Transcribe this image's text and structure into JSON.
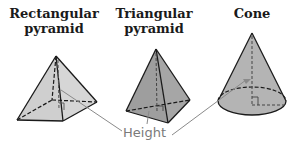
{
  "figures": [
    {
      "id": "rectangular-pyramid",
      "title_line1": "Rectangular",
      "title_line2": "pyramid"
    },
    {
      "id": "triangular-pyramid",
      "title_line1": "Triangular",
      "title_line2": "pyramid"
    },
    {
      "id": "cone",
      "title_line1": "Cone",
      "title_line2": ""
    }
  ],
  "label": {
    "height": "Height"
  },
  "colors": {
    "rect_fill": "#d6d6d6",
    "tri_fill": "#9e9e9e",
    "cone_fill": "#b4b4b4",
    "outline": "#1a1a1a",
    "label": "#7a7a7a",
    "leader": "#8a8a8a"
  }
}
